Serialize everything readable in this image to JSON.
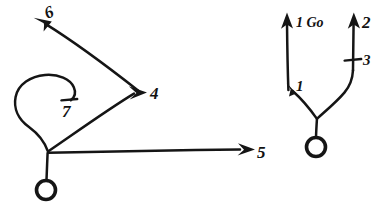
{
  "figure": {
    "background_color": "#ffffff",
    "ink_color": "#151515",
    "width": 390,
    "height": 209
  },
  "left_graph": {
    "name": "left-node-graph",
    "root_label": "",
    "branches": [
      {
        "id": "branch-6",
        "label": "6",
        "arrow": "up-left",
        "terminator": "arrowhead"
      },
      {
        "id": "branch-4",
        "label": "4",
        "arrow": "up-right",
        "terminator": "arrowhead"
      },
      {
        "id": "branch-5",
        "label": "5",
        "arrow": "right",
        "terminator": "arrowhead"
      },
      {
        "id": "branch-7",
        "label": "7",
        "arrow": "loop",
        "terminator": "tick"
      }
    ]
  },
  "right_graph": {
    "name": "right-node-graph",
    "annotation": "1 Go",
    "branches": [
      {
        "id": "branch-1-go",
        "label": "1 Go",
        "arrow": "up",
        "terminator": "arrowhead"
      },
      {
        "id": "branch-1",
        "label": "1",
        "arrow": "up-left",
        "terminator": "arrowhead"
      },
      {
        "id": "branch-2",
        "label": "2",
        "arrow": "up",
        "terminator": "arrowhead"
      },
      {
        "id": "branch-3",
        "label": "3",
        "arrow": "up",
        "terminator": "tick"
      }
    ]
  },
  "labels": {
    "six": "6",
    "four": "4",
    "five": "5",
    "seven": "7",
    "one_go": "1 Go",
    "one": "1",
    "two": "2",
    "three": "3"
  }
}
